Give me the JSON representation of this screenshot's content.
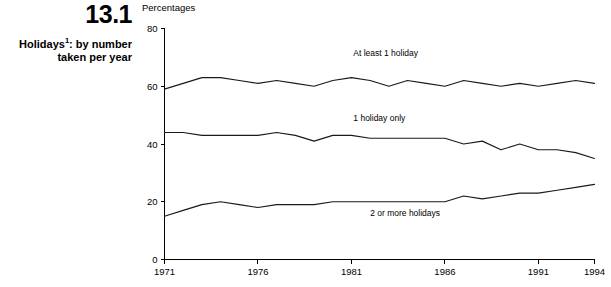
{
  "figure": {
    "number": "13.1",
    "title_line1": "Holidays",
    "title_footnote_marker": "1",
    "title_line1_rest": ": by number",
    "title_line2": "taken per year",
    "unit_label": "Percentages",
    "footnote_text": ""
  },
  "chart_data": {
    "type": "line",
    "title": "Holidays1: by number taken per year",
    "xlabel": "",
    "ylabel": "Percentages",
    "xlim": [
      1971,
      1994
    ],
    "ylim": [
      0,
      80
    ],
    "yticks": [
      0,
      20,
      40,
      60,
      80
    ],
    "ytick_labels": [
      "0",
      "20",
      "40",
      "60",
      "80"
    ],
    "xticks": [
      1971,
      1976,
      1981,
      1986,
      1991,
      1994
    ],
    "xtick_labels": [
      "1971",
      "1976",
      "1981",
      "1986",
      "1991",
      "1994"
    ],
    "grid": false,
    "legend_position": "inline-annotations",
    "x": [
      1971,
      1972,
      1973,
      1974,
      1975,
      1976,
      1977,
      1978,
      1979,
      1980,
      1981,
      1982,
      1983,
      1984,
      1985,
      1986,
      1987,
      1988,
      1989,
      1990,
      1991,
      1992,
      1993,
      1994
    ],
    "series": [
      {
        "name": "At least 1 holiday",
        "label": "At least 1 holiday",
        "label_x": 1981.1,
        "label_y": 70.5,
        "values": [
          59,
          61,
          63,
          63,
          62,
          61,
          62,
          61,
          60,
          62,
          63,
          62,
          60,
          62,
          61,
          60,
          62,
          61,
          60,
          61,
          60,
          61,
          62,
          61
        ]
      },
      {
        "name": "1 holiday only",
        "label": "1 holiday only",
        "label_x": 1981.1,
        "label_y": 48.0,
        "values": [
          44,
          44,
          43,
          43,
          43,
          43,
          44,
          43,
          41,
          43,
          43,
          42,
          42,
          42,
          42,
          42,
          40,
          41,
          38,
          40,
          38,
          38,
          37,
          35
        ]
      },
      {
        "name": "2 or more holidays",
        "label": "2 or more holidays",
        "label_x": 1982.0,
        "label_y": 15.0,
        "values": [
          15,
          17,
          19,
          20,
          19,
          18,
          19,
          19,
          19,
          20,
          20,
          20,
          20,
          20,
          20,
          20,
          22,
          21,
          22,
          23,
          23,
          24,
          25,
          26
        ]
      }
    ]
  },
  "colors": {
    "line": "#1a1a1a",
    "axis": "#000000",
    "background": "#ffffff"
  }
}
